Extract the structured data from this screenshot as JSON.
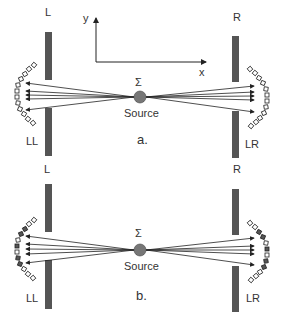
{
  "panels": [
    {
      "id": "a",
      "caption": "a.",
      "left_wall_label": "L",
      "right_wall_label": "R",
      "left_detector_label": "LL",
      "right_detector_label": "LR",
      "source_symbol": "Σ",
      "source_label": "Source",
      "detector_cells_filled": false
    },
    {
      "id": "b",
      "caption": "b.",
      "left_wall_label": "L",
      "right_wall_label": "R",
      "left_detector_label": "LL",
      "right_detector_label": "LR",
      "source_symbol": "Σ",
      "source_label": "Source",
      "detector_cells_filled": true
    }
  ],
  "axes": {
    "x_label": "x",
    "y_label": "y"
  },
  "colors": {
    "wall": "#555555",
    "source": "#777777",
    "line": "#222222"
  }
}
